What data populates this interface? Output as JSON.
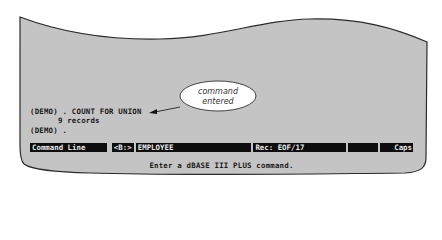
{
  "callout": {
    "line1": "command",
    "line2": "entered"
  },
  "console": {
    "lines": [
      "(DEMO) . COUNT FOR UNION",
      "      9 records",
      "(DEMO) ."
    ]
  },
  "status_bar": {
    "mode": "Command Line",
    "drive": "<B:>",
    "database": "EMPLOYEE",
    "record": "Rec: EOF/17",
    "blank": "",
    "caps": "Caps"
  },
  "message": "Enter a dBASE III PLUS command.",
  "colors": {
    "screen_fill": "#c4c4c4",
    "status_bg": "#0d0d0d",
    "status_text": "#e8e8e8"
  }
}
